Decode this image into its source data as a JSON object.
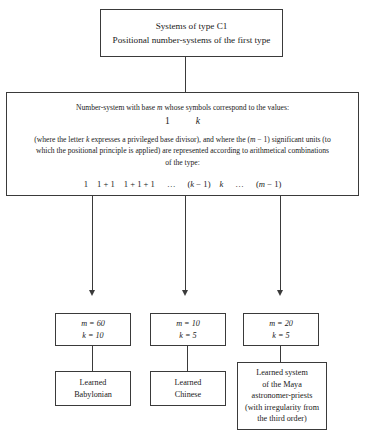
{
  "diagram": {
    "title_box": {
      "line1": "Systems of type C1",
      "line2": "Positional number-systems of the first type"
    },
    "description_box": {
      "lead": "Number-system with base m whose symbols correspond to the values:",
      "value_left": "1",
      "value_right": "k",
      "paragraph": "(where the letter k expresses a privileged base divisor), and where the (m − 1) significant units (to which the positional principle is applied) are represented according to arithmetical combinations of the type:",
      "formula_terms": [
        "1",
        "1 + 1",
        "1 + 1 + 1",
        "…",
        "(k − 1)",
        "k",
        "…",
        "(m − 1)"
      ]
    },
    "branches": [
      {
        "params": {
          "m_label": "m = 60",
          "k_label": "k = 10"
        },
        "result_lines": [
          "Learned",
          "Babylonian"
        ]
      },
      {
        "params": {
          "m_label": "m = 10",
          "k_label": "k = 5"
        },
        "result_lines": [
          "Learned",
          "Chinese"
        ]
      },
      {
        "params": {
          "m_label": "m = 20",
          "k_label": "k = 5"
        },
        "result_lines": [
          "Learned system",
          "of the Maya",
          "astronomer-priests",
          "(with irregularity from",
          "the third order)"
        ]
      }
    ]
  },
  "colors": {
    "stroke": "#3a3a3a",
    "background": "#ffffff",
    "text": "#1a1a1a"
  }
}
